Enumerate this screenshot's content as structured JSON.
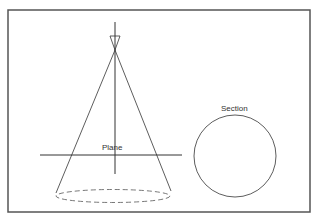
{
  "diagram": {
    "labels": {
      "plane": "Plane",
      "section": "Section"
    },
    "colors": {
      "stroke": "#333333",
      "frame": "#555555",
      "background": "#ffffff"
    }
  }
}
